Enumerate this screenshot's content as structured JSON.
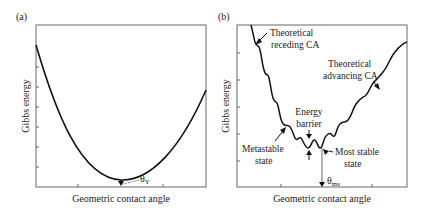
{
  "panels": [
    {
      "id": "a",
      "label": "(a)",
      "xlabel": "Geometric contact angle",
      "ylabel": "Gibbs energy",
      "annotations": {
        "theta_main": "θ",
        "theta_sub": "Y"
      }
    },
    {
      "id": "b",
      "label": "(b)",
      "xlabel": "Geometric contact angle",
      "ylabel": "Gibbs energy",
      "annotations": {
        "receding_line1": "Theoretical",
        "receding_line2": "receding CA",
        "advancing_line1": "Theoretical",
        "advancing_line2": "advancing CA",
        "barrier_line1": "Energy",
        "barrier_line2": "barrier",
        "metastable_line1": "Metastable",
        "metastable_line2": "state",
        "moststable_line1": "Most stable",
        "moststable_line2": "state",
        "theta_main": "θ",
        "theta_sub": "ms"
      }
    }
  ],
  "colors": {
    "curve": "#111111",
    "frame": "#555555",
    "text": "#1a1a1a"
  }
}
